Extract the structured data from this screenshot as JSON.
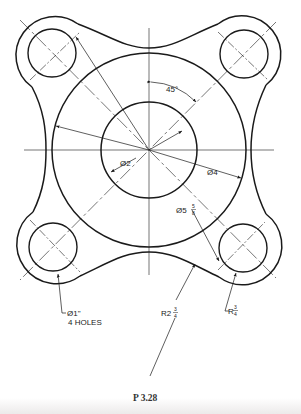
{
  "figure": {
    "caption": "P 3.28",
    "type": "mechanical-drawing"
  },
  "dimensions": {
    "angle": "45°",
    "inner_diameter": {
      "symbol": "Ø",
      "value": "2"
    },
    "outer_diameter": {
      "symbol": "Ø",
      "value": "4"
    },
    "bolt_circle": {
      "symbol": "Ø",
      "whole": "5",
      "num": "5",
      "den": "8"
    },
    "hole_size": {
      "symbol": "Ø",
      "value": "1\""
    },
    "hole_count": "4 HOLES",
    "concave_radius": {
      "prefix": "R",
      "whole": "2",
      "num": "3",
      "den": "4"
    },
    "lobe_radius": {
      "prefix": "R",
      "num": "3",
      "den": "4"
    }
  },
  "geometry": {
    "center": [
      149,
      150
    ],
    "inner_circle_r": 48,
    "outer_circle_r": 97,
    "hole_r": 24,
    "lobe_r": 36,
    "holes": [
      [
        52,
        53
      ],
      [
        244,
        54
      ],
      [
        53,
        247
      ],
      [
        243,
        248
      ]
    ]
  },
  "colors": {
    "line": "#1a1a1a",
    "background": "#ffffff"
  }
}
